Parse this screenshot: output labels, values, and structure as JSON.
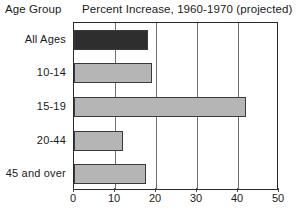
{
  "header": {
    "y_axis_title": "Age Group",
    "chart_title": "Percent Increase, 1960-1970 (projected)"
  },
  "chart_data": {
    "type": "bar",
    "orientation": "horizontal",
    "title": "Percent Increase, 1960-1970 (projected)",
    "xlabel": "",
    "ylabel": "Age Group",
    "categories": [
      "All Ages",
      "10-14",
      "15-19",
      "20-44",
      "45 and over"
    ],
    "values": [
      18,
      19,
      42,
      12,
      17.5
    ],
    "xlim": [
      0,
      50
    ],
    "xticks": [
      0,
      10,
      20,
      30,
      40,
      50
    ],
    "xtick_labels": [
      "0",
      "10",
      "20",
      "30",
      "40",
      "50"
    ],
    "grid": "vertical",
    "legend": "none",
    "bar_colors": [
      "#2e2e2e",
      "#b5b5b5",
      "#b5b5b5",
      "#b5b5b5",
      "#b5b5b5"
    ],
    "bar_edge_color": "#3a3a3a",
    "frame_color": "#2a2a2a",
    "gridline_color": "#6f6f6f",
    "background": "#ffffff"
  }
}
